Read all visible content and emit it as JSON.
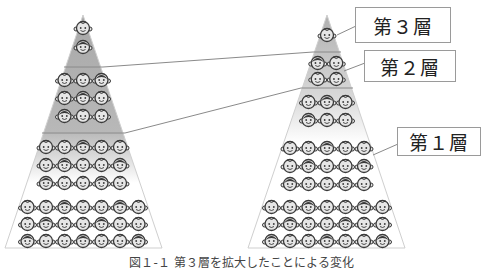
{
  "labels": {
    "layer3": "第３層",
    "layer2": "第２層",
    "layer1": "第１層"
  },
  "caption": "図１-１ 第３層を拡大したことによる変化",
  "colors": {
    "pyramid_dark": "#a8a8a8",
    "pyramid_light": "#ffffff",
    "line": "#8a8a8a",
    "face_fill": "#e6e6e6",
    "face_stroke": "#3a3a3a"
  },
  "pyramids": [
    {
      "name": "before",
      "rows": [
        1,
        1,
        3,
        3,
        3,
        5,
        5,
        5,
        7,
        7,
        7
      ],
      "layer_boundaries_after_row": [
        2,
        5
      ]
    },
    {
      "name": "after",
      "rows": [
        1,
        2,
        2,
        3,
        3,
        5,
        5,
        5,
        7,
        7,
        7
      ],
      "layer_boundaries_after_row": [
        1,
        3
      ]
    }
  ]
}
